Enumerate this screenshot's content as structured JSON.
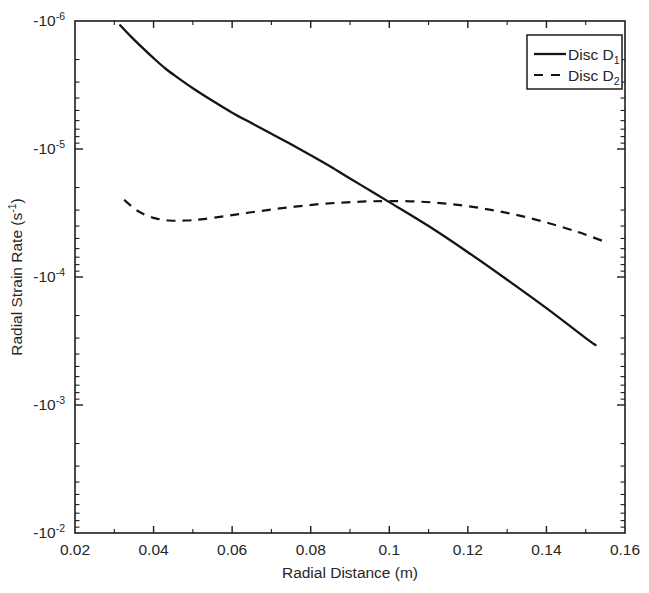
{
  "chart_data": {
    "type": "line",
    "title": "",
    "xlabel": "Radial Distance (m)",
    "ylabel": "Radial Strain Rate (s-1)",
    "ylabel_base": "Radial Strain Rate (s",
    "ylabel_exp": "-1",
    "ylabel_tail": ")",
    "xlim": [
      0.02,
      0.16
    ],
    "ylim": [
      -1e-06,
      -0.01
    ],
    "yscale": "log-negative",
    "xscale": "linear",
    "grid": false,
    "legend_position": "top-right",
    "xticks": [
      "0.02",
      "0.04",
      "0.06",
      "0.08",
      "0.1",
      "0.12",
      "0.14",
      "0.16"
    ],
    "xtick_values": [
      0.02,
      0.04,
      0.06,
      0.08,
      0.1,
      0.12,
      0.14,
      0.16
    ],
    "yticks": [
      "-10-6",
      "-10-5",
      "-10-4",
      "-10-3",
      "-10-2"
    ],
    "ytick_exponents": [
      "-6",
      "-5",
      "-4",
      "-3",
      "-2"
    ],
    "ytick_prefix": "-10",
    "ytick_values": [
      -1e-06,
      -1e-05,
      -0.0001,
      -0.001,
      -0.01
    ],
    "series": [
      {
        "name": "Disc D1",
        "label_base": "Disc D",
        "label_sub": "1",
        "style": "solid",
        "color": "#141414",
        "x": [
          0.0315,
          0.034,
          0.037,
          0.04,
          0.043,
          0.046,
          0.05,
          0.055,
          0.06,
          0.065,
          0.07,
          0.075,
          0.08,
          0.085,
          0.09,
          0.095,
          0.1,
          0.11,
          0.12,
          0.13,
          0.14,
          0.15,
          0.1525
        ],
        "y": [
          -1.08e-06,
          -1.3e-06,
          -1.6e-06,
          -1.95e-06,
          -2.35e-06,
          -2.75e-06,
          -3.35e-06,
          -4.2e-06,
          -5.2e-06,
          -6.3e-06,
          -7.6e-06,
          -9.2e-06,
          -1.12e-05,
          -1.37e-05,
          -1.7e-05,
          -2.1e-05,
          -2.6e-05,
          -4e-05,
          -6.4e-05,
          -0.000105,
          -0.000175,
          -0.0003,
          -0.00034
        ]
      },
      {
        "name": "Disc D2",
        "label_base": "Disc D",
        "label_sub": "2",
        "style": "dashed",
        "color": "#141414",
        "x": [
          0.0325,
          0.036,
          0.04,
          0.044,
          0.048,
          0.052,
          0.058,
          0.064,
          0.07,
          0.076,
          0.082,
          0.088,
          0.094,
          0.1,
          0.108,
          0.116,
          0.124,
          0.132,
          0.14,
          0.148,
          0.1545
        ],
        "y": [
          -2.5e-05,
          -3.05e-05,
          -3.45e-05,
          -3.62e-05,
          -3.62e-05,
          -3.55e-05,
          -3.35e-05,
          -3.15e-05,
          -2.97e-05,
          -2.82e-05,
          -2.7e-05,
          -2.62e-05,
          -2.57e-05,
          -2.55e-05,
          -2.58e-05,
          -2.7e-05,
          -2.92e-05,
          -3.25e-05,
          -3.75e-05,
          -4.45e-05,
          -5.25e-05
        ]
      }
    ]
  },
  "axes": {
    "xlabel": "Radial Distance (m)"
  },
  "legend": {
    "entries": [
      {
        "label_base": "Disc D",
        "label_sub": "1",
        "style": "solid"
      },
      {
        "label_base": "Disc D",
        "label_sub": "2",
        "style": "dashed"
      }
    ]
  }
}
